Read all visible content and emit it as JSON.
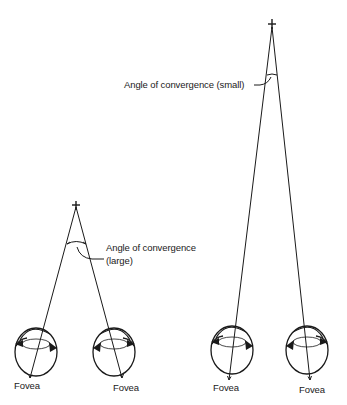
{
  "diagram": {
    "left_panel": {
      "angle_label_line1": "Angle of convergence",
      "angle_label_line2": "(large)",
      "left_eye_label": "Fovea",
      "right_eye_label": "Fovea"
    },
    "right_panel": {
      "angle_label": "Angle of convergence (small)",
      "left_eye_label": "Fovea",
      "right_eye_label": "Fovea"
    },
    "colors": {
      "stroke": "#1a1a1a",
      "background": "#ffffff"
    }
  }
}
